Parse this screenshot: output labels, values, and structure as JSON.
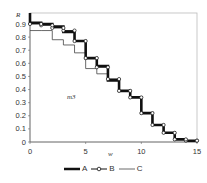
{
  "chart_data": {
    "type": "line",
    "subtype": "step",
    "title": "",
    "xlabel": "w",
    "ylabel": "R",
    "annotation": "m3",
    "xlim": [
      0,
      15
    ],
    "ylim": [
      0,
      0.98
    ],
    "xticks": [
      "0",
      "5",
      "10",
      "15"
    ],
    "yticks": [
      "0",
      "0.1",
      "0.2",
      "0.3",
      "0.4",
      "0.5",
      "0.6",
      "0.7",
      "0.8",
      "0.9"
    ],
    "grid": false,
    "legend_position": "bottom",
    "x": [
      0,
      1,
      2,
      3,
      4,
      5,
      6,
      7,
      8,
      9,
      10,
      11,
      12,
      13,
      14,
      15
    ],
    "series": [
      {
        "name": "A",
        "style": "thick",
        "values": [
          0.91,
          0.9,
          0.88,
          0.84,
          0.77,
          0.64,
          0.58,
          0.47,
          0.39,
          0.34,
          0.22,
          0.13,
          0.07,
          0.02,
          0.01,
          0.01
        ]
      },
      {
        "name": "B",
        "style": "circle-markers",
        "values": [
          0.9,
          0.89,
          0.87,
          0.85,
          0.77,
          0.64,
          0.57,
          0.48,
          0.39,
          0.34,
          0.22,
          0.13,
          0.07,
          0.02,
          0.01,
          0.01
        ]
      },
      {
        "name": "C",
        "style": "thin",
        "values": [
          0.85,
          0.85,
          0.78,
          0.74,
          0.68,
          0.56,
          0.52,
          0.48,
          0.39,
          0.34,
          0.22,
          0.13,
          0.07,
          0.02,
          0.01,
          0.01
        ]
      }
    ]
  },
  "legend": {
    "a": "A",
    "b": "B",
    "c": "C"
  },
  "axes": {
    "x_label": "w",
    "y_label": "R",
    "annotation": "m3"
  }
}
